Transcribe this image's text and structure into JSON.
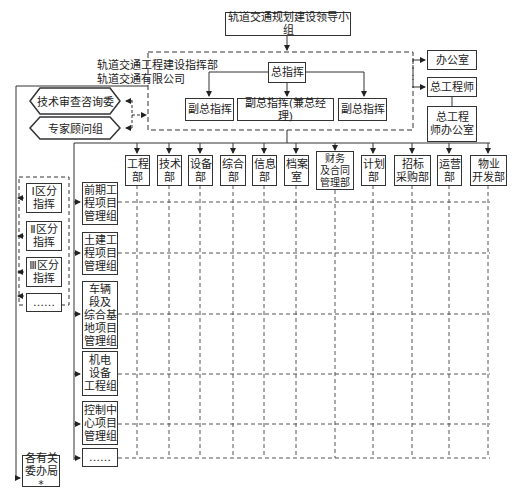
{
  "diagram": {
    "top": "轨道交通规划建设领导小组",
    "hq_label": "轨道交通工程建设指挥部\n轨道交通有限公司",
    "commander": "总指挥",
    "deputies": [
      "副总指挥",
      "副总指挥(兼总经理)",
      "副总指挥"
    ],
    "right": {
      "office": "办公室",
      "chief_engineer": "总工程师",
      "chief_engineer_office": "总工程\n师办公室"
    },
    "advisory": [
      "技术审查咨询委",
      "专家顾问组"
    ],
    "departments": [
      "工程\n部",
      "技术\n部",
      "设备\n部",
      "综合\n部",
      "信息\n部",
      "档案\n室",
      "财务\n及合同\n管理部",
      "计划\n部",
      "招标\n采购部",
      "运营\n部",
      "物业\n开发部"
    ],
    "districts": [
      "Ⅰ区分\n指挥",
      "Ⅱ区分\n指挥",
      "Ⅲ区分\n指挥",
      "……"
    ],
    "groups": [
      "前期工\n程项目\n管理组",
      "土建工\n程项目\n管理组",
      "车辆\n段及\n综合基\n地项目\n管理组",
      "机电\n设备\n工程组",
      "控制中\n心项目\n管理组",
      "……"
    ],
    "bottom_left": "各有关\n委办局*"
  }
}
